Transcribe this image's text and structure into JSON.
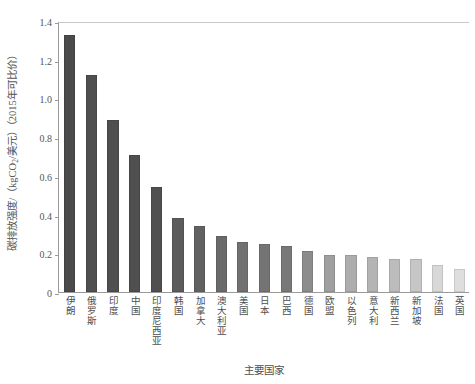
{
  "chart_data": {
    "type": "bar",
    "title": "",
    "subtitle": "",
    "xlabel": "主要国家",
    "ylabel": "碳排放强度/（kgCO2/美元）（2015年可比价）",
    "ylabel_parts": {
      "pre": "碳排放强度/（kgCO",
      "sub": "2",
      "post": "/美元）（2015年可比价）"
    },
    "ylim": [
      0,
      1.4
    ],
    "yticks": [
      "0",
      "0.2",
      "0.4",
      "0.6",
      "0.8",
      "1.0",
      "1.2",
      "1.4"
    ],
    "ytick_values": [
      0,
      0.2,
      0.4,
      0.6,
      0.8,
      1.0,
      1.2,
      1.4
    ],
    "grid": false,
    "legend": "none",
    "categories": [
      "伊朗",
      "俄罗斯",
      "印度",
      "中国",
      "印度尼西亚",
      "韩国",
      "加拿大",
      "澳大利亚",
      "美国",
      "日本",
      "巴西",
      "德国",
      "欧盟",
      "以色列",
      "意大利",
      "新西兰",
      "新加坡",
      "法国",
      "英国"
    ],
    "values": [
      1.33,
      1.12,
      0.89,
      0.71,
      0.54,
      0.38,
      0.34,
      0.29,
      0.26,
      0.25,
      0.24,
      0.21,
      0.19,
      0.19,
      0.18,
      0.17,
      0.17,
      0.14,
      0.12
    ],
    "bar_colors": [
      "#4a4a4a",
      "#4f4f4f",
      "#4f4f4f",
      "#4f4f4f",
      "#505050",
      "#5c5c5c",
      "#616161",
      "#6a6a6a",
      "#717171",
      "#747474",
      "#787878",
      "#8c8c8c",
      "#9f9f9f",
      "#adadad",
      "#b4b4b4",
      "#bcbcbc",
      "#c6c6c6",
      "#d8d8d8",
      "#dedede"
    ],
    "axis_color": "#9a9a9a",
    "text_color": "#4e4e4e"
  }
}
